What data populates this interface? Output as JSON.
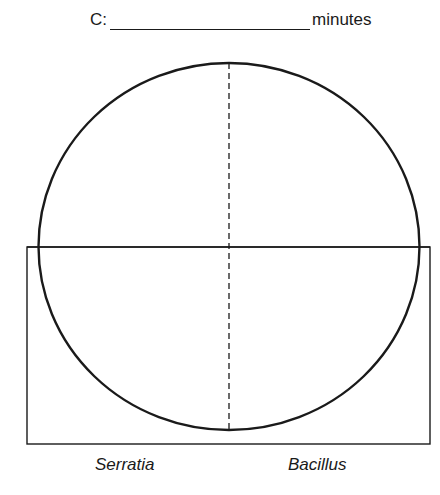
{
  "header": {
    "prefix": "C:",
    "suffix": "minutes"
  },
  "diagram": {
    "labels": {
      "left": "Serratia",
      "right": "Bacillus"
    },
    "colors": {
      "stroke": "#1a1a1a",
      "background": "#ffffff"
    }
  }
}
